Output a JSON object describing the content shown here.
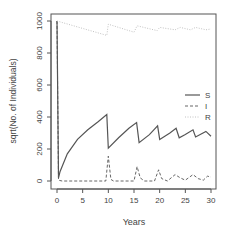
{
  "chart_data": {
    "type": "line",
    "title": "",
    "xlabel": "Years",
    "ylabel": "sqrt(No. of Individuals)",
    "xlim": [
      0,
      30
    ],
    "ylim": [
      0,
      1000
    ],
    "x_ticks": [
      "0",
      "5",
      "10",
      "15",
      "20",
      "25",
      "30"
    ],
    "y_ticks": [
      "0",
      "200",
      "400",
      "600",
      "800",
      "1000"
    ],
    "grid": false,
    "legend_position": "right-middle",
    "series": [
      {
        "name": "S",
        "style": "solid",
        "color": "#555555",
        "points": [
          [
            0,
            1000
          ],
          [
            0.3,
            20
          ],
          [
            0.6,
            60
          ],
          [
            2,
            170
          ],
          [
            4,
            260
          ],
          [
            6,
            320
          ],
          [
            8,
            370
          ],
          [
            9.7,
            415
          ],
          [
            10,
            205
          ],
          [
            12,
            270
          ],
          [
            14,
            330
          ],
          [
            15.5,
            365
          ],
          [
            16,
            240
          ],
          [
            18,
            290
          ],
          [
            19.6,
            345
          ],
          [
            20,
            260
          ],
          [
            22,
            300
          ],
          [
            23.2,
            330
          ],
          [
            23.8,
            270
          ],
          [
            25,
            290
          ],
          [
            26.5,
            320
          ],
          [
            27,
            275
          ],
          [
            29,
            310
          ],
          [
            30,
            280
          ]
        ]
      },
      {
        "name": "I",
        "style": "dashed",
        "color": "#555555",
        "points": [
          [
            0,
            1000
          ],
          [
            0.3,
            5
          ],
          [
            1,
            0
          ],
          [
            9.5,
            0
          ],
          [
            10,
            155
          ],
          [
            10.5,
            10
          ],
          [
            11,
            0
          ],
          [
            15,
            0
          ],
          [
            15.6,
            90
          ],
          [
            16.2,
            20
          ],
          [
            17,
            0
          ],
          [
            19,
            0
          ],
          [
            19.8,
            70
          ],
          [
            20.4,
            15
          ],
          [
            21.5,
            0
          ],
          [
            23,
            40
          ],
          [
            24,
            20
          ],
          [
            25,
            5
          ],
          [
            26.5,
            40
          ],
          [
            27.5,
            15
          ],
          [
            28.5,
            5
          ],
          [
            29.3,
            30
          ],
          [
            30,
            25
          ]
        ]
      },
      {
        "name": "R",
        "style": "dotted",
        "color": "#bbbbbb",
        "points": [
          [
            0,
            1000
          ],
          [
            9.7,
            910
          ],
          [
            10,
            980
          ],
          [
            15,
            930
          ],
          [
            15.6,
            970
          ],
          [
            19.5,
            940
          ],
          [
            20,
            960
          ],
          [
            23,
            945
          ],
          [
            24,
            960
          ],
          [
            26,
            945
          ],
          [
            27,
            960
          ],
          [
            29,
            945
          ],
          [
            30,
            950
          ]
        ]
      }
    ]
  },
  "legend": {
    "items": [
      {
        "label": "S"
      },
      {
        "label": "I"
      },
      {
        "label": "R"
      }
    ]
  }
}
